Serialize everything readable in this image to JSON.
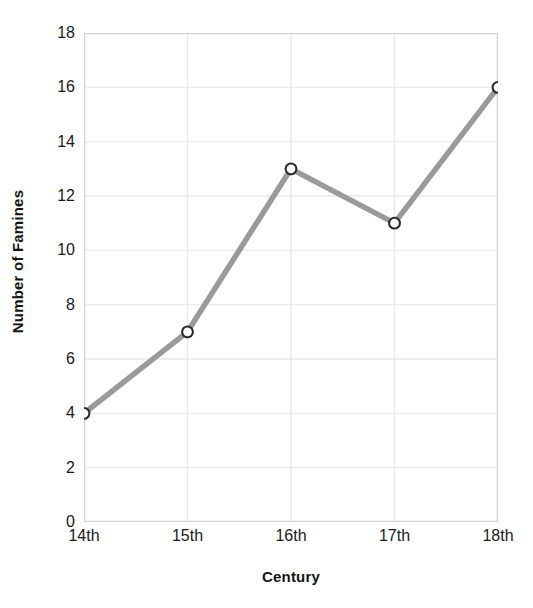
{
  "chart_data": {
    "type": "line",
    "title": "",
    "xlabel": "Century",
    "ylabel": "Number of Famines",
    "categories": [
      "14th",
      "15th",
      "16th",
      "17th",
      "18th"
    ],
    "values": [
      4,
      7,
      13,
      11,
      16
    ],
    "series": [
      {
        "name": "Number of Famines",
        "values": [
          4,
          7,
          13,
          11,
          16
        ]
      }
    ],
    "ylim": [
      0,
      18
    ],
    "y_ticks": [
      0,
      2,
      4,
      6,
      8,
      10,
      12,
      14,
      16,
      18
    ],
    "y_tick_labels": [
      "0",
      "2",
      "4",
      "6",
      "8",
      "10",
      "12",
      "14",
      "16",
      "18"
    ],
    "x_tick_labels": [
      "14th",
      "15th",
      "16th",
      "17th",
      "18th"
    ],
    "grid": true,
    "legend": false,
    "legend_position": "none",
    "line_color": "#9a9a9a",
    "marker_fill_color": "#ffffff",
    "marker_edge_color": "#2b2b2b",
    "grid_color": "#e9e9e9",
    "axis_border_color": "#d5d5d5",
    "background_color": "#ffffff",
    "text_color": "#1a1a1a",
    "points": [
      {
        "x": "14th",
        "y": 4
      },
      {
        "x": "15th",
        "y": 7
      },
      {
        "x": "16th",
        "y": 13
      },
      {
        "x": "17th",
        "y": 11
      },
      {
        "x": "18th",
        "y": 16
      }
    ]
  }
}
